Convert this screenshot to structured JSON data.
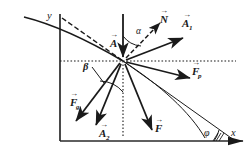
{
  "figure": {
    "type": "vector-force-diagram",
    "background": "#ffffff",
    "stroke_color": "#1a1a1a",
    "axes": {
      "x_label": "x",
      "y_label": "y",
      "origin_px": [
        60,
        141
      ],
      "x_end_px": [
        243,
        141
      ],
      "y_top_px": [
        60,
        14
      ]
    },
    "vertex_px": [
      123,
      61
    ],
    "guides": {
      "horizontal_dotted_label": "horizontal-dotted-guide",
      "vertical_dotted_label": "vertical-dotted-guide",
      "trajectory_label": "trajectory-curve",
      "tangent_label": "tangent-dashed-line"
    },
    "vectors": [
      {
        "name": "A",
        "label": "A",
        "subscript": "",
        "dashed": false,
        "tip_px": [
          123,
          57
        ],
        "tail_px": [
          123,
          14
        ]
      },
      {
        "name": "N",
        "label": "N",
        "subscript": "",
        "dashed": true,
        "tip_px": [
          160,
          23
        ],
        "tail_px": [
          126,
          58
        ]
      },
      {
        "name": "A1",
        "label": "A",
        "subscript": "1",
        "dashed": false,
        "tip_px": [
          183,
          38
        ],
        "tail_px": [
          126,
          60
        ]
      },
      {
        "name": "Fp",
        "label": "F",
        "subscript": "p",
        "dashed": false,
        "tip_px": [
          190,
          78
        ],
        "tail_px": [
          126,
          62
        ]
      },
      {
        "name": "F",
        "label": "F",
        "subscript": "",
        "dashed": false,
        "tip_px": [
          152,
          130
        ],
        "tail_px": [
          125,
          64
        ]
      },
      {
        "name": "A2",
        "label": "A",
        "subscript": "2",
        "dashed": false,
        "tip_px": [
          96,
          125
        ],
        "tail_px": [
          121,
          64
        ]
      },
      {
        "name": "Fg",
        "label": "F",
        "subscript": "g",
        "dashed": false,
        "tip_px": [
          76,
          121
        ],
        "tail_px": [
          120,
          63
        ]
      }
    ],
    "angles": [
      {
        "name": "alpha",
        "label": "α",
        "label_px": [
          139,
          30
        ],
        "between": [
          "A",
          "N"
        ]
      },
      {
        "name": "beta",
        "label": "β",
        "label_px": [
          86,
          71
        ],
        "between": [
          "vertical-dotted-guide",
          "Fg"
        ]
      },
      {
        "name": "phi",
        "label": "φ",
        "label_px": [
          209,
          131
        ],
        "between": [
          "chord",
          "x-axis"
        ]
      }
    ],
    "vector_arrow_overbar": "→"
  }
}
